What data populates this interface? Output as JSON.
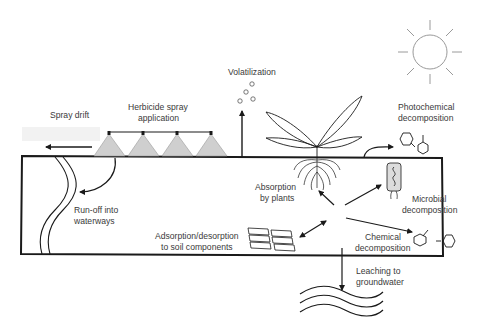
{
  "diagram": {
    "colors": {
      "line": "#1a1a1a",
      "text": "#3a3a3a",
      "spray_fill": "#cfcfcf",
      "microbe_fill": "#dcdcdc",
      "sun": "#9a9a9a"
    },
    "labels": {
      "spray_drift": "Spray drift",
      "herbicide_spray_1": "Herbicide spray",
      "herbicide_spray_2": "application",
      "volatilization": "Volatilization",
      "photochemical_1": "Photochemical",
      "photochemical_2": "decomposition",
      "runoff_1": "Run-off into",
      "runoff_2": "waterways",
      "absorption_1": "Absorption",
      "absorption_2": "by plants",
      "microbial_1": "Microbial",
      "microbial_2": "decomposition",
      "adsorption_1": "Adsorption/desorption",
      "adsorption_2": "to soil components",
      "chemical_1": "Chemical",
      "chemical_2": "decomposition",
      "leaching_1": "Leaching to",
      "leaching_2": "groundwater"
    },
    "icons": [
      "sun-icon",
      "sprayer-icon",
      "plant-icon",
      "root-icon",
      "microbe-icon",
      "molecule-icon",
      "soil-particles-icon",
      "groundwater-waves-icon",
      "waterway-icon",
      "vapor-bubbles-icon"
    ]
  }
}
